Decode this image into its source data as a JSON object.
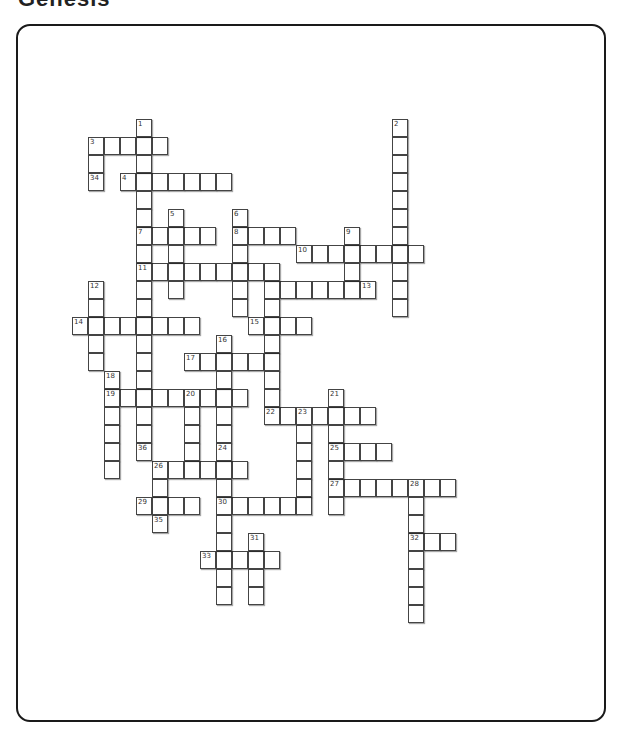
{
  "title": "Genesis",
  "grid": {
    "origin_x": 72,
    "origin_y": 119,
    "cell_w": 16,
    "cell_h": 18,
    "across": [
      {
        "num": "3",
        "row": 1,
        "col": 1,
        "len": 5
      },
      {
        "num": "4",
        "row": 3,
        "col": 3,
        "len": 7
      },
      {
        "num": "7",
        "row": 6,
        "col": 4,
        "len": 5
      },
      {
        "num": "8",
        "row": 6,
        "col": 10,
        "len": 4
      },
      {
        "num": "10",
        "row": 7,
        "col": 14,
        "len": 8
      },
      {
        "num": "11",
        "row": 8,
        "col": 4,
        "len": 8
      },
      {
        "num": "",
        "row": 9,
        "col": 12,
        "len": 7
      },
      {
        "num": "14",
        "row": 11,
        "col": 0,
        "len": 8
      },
      {
        "num": "15",
        "row": 11,
        "col": 11,
        "len": 4
      },
      {
        "num": "17",
        "row": 13,
        "col": 7,
        "len": 6
      },
      {
        "num": "19",
        "row": 15,
        "col": 2,
        "len": 9
      },
      {
        "num": "22",
        "row": 16,
        "col": 12,
        "len": 7
      },
      {
        "num": "25",
        "row": 18,
        "col": 16,
        "len": 4
      },
      {
        "num": "26",
        "row": 19,
        "col": 5,
        "len": 6
      },
      {
        "num": "27",
        "row": 20,
        "col": 16,
        "len": 8
      },
      {
        "num": "29",
        "row": 21,
        "col": 4,
        "len": 4
      },
      {
        "num": "30",
        "row": 21,
        "col": 9,
        "len": 6
      },
      {
        "num": "32",
        "row": 23,
        "col": 21,
        "len": 3
      },
      {
        "num": "33",
        "row": 24,
        "col": 8,
        "len": 5
      }
    ],
    "down": [
      {
        "num": "1",
        "row": 0,
        "col": 4,
        "len": 19
      },
      {
        "num": "2",
        "row": 0,
        "col": 20,
        "len": 11
      },
      {
        "num": "34",
        "row": 1,
        "col": 1,
        "len": 3
      },
      {
        "num": "5",
        "row": 5,
        "col": 6,
        "len": 5
      },
      {
        "num": "6",
        "row": 5,
        "col": 10,
        "len": 6
      },
      {
        "num": "9",
        "row": 6,
        "col": 17,
        "len": 4
      },
      {
        "num": "",
        "row": 8,
        "col": 12,
        "len": 9
      },
      {
        "num": "12",
        "row": 9,
        "col": 1,
        "len": 5
      },
      {
        "num": "16",
        "row": 12,
        "col": 9,
        "len": 6
      },
      {
        "num": "18",
        "row": 14,
        "col": 2,
        "len": 6
      },
      {
        "num": "20",
        "row": 15,
        "col": 7,
        "len": 5
      },
      {
        "num": "21",
        "row": 15,
        "col": 16,
        "len": 7
      },
      {
        "num": "23",
        "row": 16,
        "col": 14,
        "len": 6
      },
      {
        "num": "24",
        "row": 18,
        "col": 9,
        "len": 9
      },
      {
        "num": "36",
        "row": 18,
        "col": 4,
        "len": 1
      },
      {
        "num": "",
        "row": 19,
        "col": 5,
        "len": 4
      },
      {
        "num": "28",
        "row": 20,
        "col": 21,
        "len": 8
      },
      {
        "num": "31",
        "row": 23,
        "col": 11,
        "len": 4
      },
      {
        "num": "35",
        "row": 22,
        "col": 5,
        "len": 1
      }
    ],
    "labels": [
      {
        "num": "1",
        "row": 0,
        "col": 4
      },
      {
        "num": "2",
        "row": 0,
        "col": 20
      },
      {
        "num": "3",
        "row": 1,
        "col": 1
      },
      {
        "num": "34",
        "row": 3,
        "col": 1
      },
      {
        "num": "4",
        "row": 3,
        "col": 3
      },
      {
        "num": "5",
        "row": 5,
        "col": 6
      },
      {
        "num": "6",
        "row": 5,
        "col": 10
      },
      {
        "num": "7",
        "row": 6,
        "col": 4
      },
      {
        "num": "8",
        "row": 6,
        "col": 10
      },
      {
        "num": "9",
        "row": 6,
        "col": 17
      },
      {
        "num": "10",
        "row": 7,
        "col": 14
      },
      {
        "num": "11",
        "row": 8,
        "col": 4
      },
      {
        "num": "12",
        "row": 9,
        "col": 1
      },
      {
        "num": "13",
        "row": 9,
        "col": 18
      },
      {
        "num": "14",
        "row": 11,
        "col": 0
      },
      {
        "num": "15",
        "row": 11,
        "col": 11
      },
      {
        "num": "16",
        "row": 12,
        "col": 9
      },
      {
        "num": "17",
        "row": 13,
        "col": 7
      },
      {
        "num": "18",
        "row": 14,
        "col": 2
      },
      {
        "num": "19",
        "row": 15,
        "col": 2
      },
      {
        "num": "20",
        "row": 15,
        "col": 7
      },
      {
        "num": "21",
        "row": 15,
        "col": 16
      },
      {
        "num": "22",
        "row": 16,
        "col": 12
      },
      {
        "num": "23",
        "row": 16,
        "col": 14
      },
      {
        "num": "36",
        "row": 18,
        "col": 4
      },
      {
        "num": "24",
        "row": 18,
        "col": 9
      },
      {
        "num": "25",
        "row": 18,
        "col": 16
      },
      {
        "num": "26",
        "row": 19,
        "col": 5
      },
      {
        "num": "27",
        "row": 20,
        "col": 16
      },
      {
        "num": "28",
        "row": 20,
        "col": 21
      },
      {
        "num": "29",
        "row": 21,
        "col": 4
      },
      {
        "num": "30",
        "row": 21,
        "col": 9
      },
      {
        "num": "35",
        "row": 22,
        "col": 5
      },
      {
        "num": "31",
        "row": 23,
        "col": 11
      },
      {
        "num": "32",
        "row": 23,
        "col": 21
      },
      {
        "num": "33",
        "row": 24,
        "col": 8
      }
    ]
  }
}
